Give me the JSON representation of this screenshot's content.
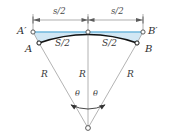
{
  "figure": {
    "background_color": "#ffffff",
    "colors": {
      "chord_line": "#6fb7dd",
      "fill_region": "#cfe6f3",
      "arc_curve": "#1a1a1a",
      "radius_line": "#8d8d8d",
      "dimension_line": "#8d8d8d",
      "label_text": "#3b3b3b",
      "marker_stroke": "#4a4a4a",
      "marker_fill": "#ffffff"
    },
    "points": [
      {
        "id": "A-prime",
        "label": "A′",
        "x": 33,
        "y": 32
      },
      {
        "id": "B-prime",
        "label": "B′",
        "x": 143,
        "y": 32
      },
      {
        "id": "A",
        "label": "A",
        "x": 39,
        "y": 43
      },
      {
        "id": "B",
        "label": "B",
        "x": 137,
        "y": 43
      },
      {
        "id": "apex",
        "label": "",
        "x": 88,
        "y": 32
      },
      {
        "id": "center",
        "label": "",
        "x": 88,
        "y": 128
      }
    ],
    "dimension_labels": [
      {
        "id": "half-span-left",
        "text": "s/2",
        "x": 53,
        "y": 9
      },
      {
        "id": "half-span-right",
        "text": "s/2",
        "x": 113,
        "y": 9
      }
    ],
    "segment_labels": [
      {
        "id": "half-arc-left",
        "text": "S/2",
        "x": 56,
        "y": 39
      },
      {
        "id": "half-arc-right",
        "text": "S/2",
        "x": 103,
        "y": 39
      }
    ],
    "radius_labels": [
      {
        "id": "radius-left",
        "text": "R",
        "x": 43,
        "y": 72
      },
      {
        "id": "radius-center",
        "text": "R",
        "x": 81,
        "y": 72
      },
      {
        "id": "radius-right",
        "text": "R",
        "x": 128,
        "y": 72
      }
    ],
    "angle_labels": [
      {
        "id": "theta-left",
        "text": "θ",
        "x": 76,
        "y": 94
      },
      {
        "id": "theta-right",
        "text": "θ",
        "x": 94,
        "y": 94
      }
    ]
  }
}
